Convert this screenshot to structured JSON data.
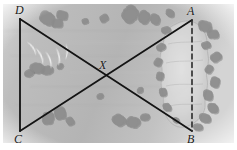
{
  "figure": {
    "name": "surveying-diagram-over-terrain-photo",
    "width": 237,
    "height": 150,
    "background_color": "#b6b6b6",
    "border_color": "#ffffff"
  },
  "labels": {
    "a": "A",
    "b": "B",
    "c": "C",
    "d": "D",
    "x": "X"
  },
  "points": {
    "A": {
      "x": 192,
      "y": 20,
      "label": "A",
      "label_x": 188,
      "label_y": 7
    },
    "B": {
      "x": 192,
      "y": 131,
      "label": "B",
      "label_x": 188,
      "label_y": 133
    },
    "C": {
      "x": 20,
      "y": 131,
      "label": "C",
      "label_x": 14,
      "label_y": 133
    },
    "D": {
      "x": 20,
      "y": 19,
      "label": "D",
      "label_x": 15,
      "label_y": 6
    },
    "X": {
      "x": 105,
      "y": 78,
      "label": "X",
      "label_x": 99,
      "label_y": 60
    }
  },
  "segments": [
    {
      "name": "segment-DC",
      "from": "D",
      "to": "C",
      "style": "solid",
      "color": "#141414",
      "width": 1.8
    },
    {
      "name": "segment-DB",
      "from": "D",
      "to": "B",
      "style": "solid",
      "color": "#141414",
      "width": 1.8
    },
    {
      "name": "segment-CA",
      "from": "C",
      "to": "A",
      "style": "solid",
      "color": "#141414",
      "width": 1.8
    },
    {
      "name": "segment-AB",
      "from": "A",
      "to": "B",
      "style": "dashed",
      "color": "#2a2a2a",
      "width": 1.6
    }
  ],
  "terrain": {
    "clearing_color": "#d8d8d8",
    "shrub_color": "#8e8e8e",
    "water_mark_color": "#f2f2f2",
    "shrubs": [
      {
        "cx": 47,
        "cy": 18,
        "r": 7
      },
      {
        "cx": 62,
        "cy": 15,
        "r": 5
      },
      {
        "cx": 57,
        "cy": 23,
        "r": 5
      },
      {
        "cx": 85,
        "cy": 21,
        "r": 3
      },
      {
        "cx": 104,
        "cy": 18,
        "r": 4
      },
      {
        "cx": 130,
        "cy": 14,
        "r": 8
      },
      {
        "cx": 144,
        "cy": 17,
        "r": 6
      },
      {
        "cx": 155,
        "cy": 19,
        "r": 5
      },
      {
        "cx": 170,
        "cy": 13,
        "r": 4
      },
      {
        "cx": 205,
        "cy": 26,
        "r": 6
      },
      {
        "cx": 213,
        "cy": 34,
        "r": 5
      },
      {
        "cx": 206,
        "cy": 45,
        "r": 4
      },
      {
        "cx": 216,
        "cy": 57,
        "r": 5
      },
      {
        "cx": 209,
        "cy": 69,
        "r": 4
      },
      {
        "cx": 215,
        "cy": 82,
        "r": 5
      },
      {
        "cx": 208,
        "cy": 95,
        "r": 5
      },
      {
        "cx": 213,
        "cy": 108,
        "r": 5
      },
      {
        "cx": 205,
        "cy": 118,
        "r": 5
      },
      {
        "cx": 198,
        "cy": 127,
        "r": 4
      },
      {
        "cx": 166,
        "cy": 30,
        "r": 4
      },
      {
        "cx": 161,
        "cy": 47,
        "r": 4
      },
      {
        "cx": 158,
        "cy": 62,
        "r": 4
      },
      {
        "cx": 160,
        "cy": 76,
        "r": 4
      },
      {
        "cx": 163,
        "cy": 92,
        "r": 4
      },
      {
        "cx": 167,
        "cy": 107,
        "r": 4
      },
      {
        "cx": 176,
        "cy": 120,
        "r": 3
      },
      {
        "cx": 37,
        "cy": 68,
        "r": 6
      },
      {
        "cx": 47,
        "cy": 70,
        "r": 5
      },
      {
        "cx": 29,
        "cy": 73,
        "r": 4
      },
      {
        "cx": 60,
        "cy": 66,
        "r": 3
      },
      {
        "cx": 48,
        "cy": 118,
        "r": 6
      },
      {
        "cx": 60,
        "cy": 113,
        "r": 6
      },
      {
        "cx": 70,
        "cy": 121,
        "r": 4
      },
      {
        "cx": 119,
        "cy": 120,
        "r": 6
      },
      {
        "cx": 133,
        "cy": 122,
        "r": 6
      },
      {
        "cx": 145,
        "cy": 117,
        "r": 4
      },
      {
        "cx": 100,
        "cy": 96,
        "r": 3
      },
      {
        "cx": 140,
        "cy": 90,
        "r": 3
      }
    ],
    "water_marks": [
      {
        "cx": 33,
        "cy": 48,
        "rx": 4,
        "ry": 8,
        "rot": -18
      },
      {
        "cx": 41,
        "cy": 56,
        "rx": 4,
        "ry": 9,
        "rot": -10
      },
      {
        "cx": 50,
        "cy": 60,
        "rx": 4,
        "ry": 9,
        "rot": -4
      },
      {
        "cx": 59,
        "cy": 57,
        "rx": 4,
        "ry": 9,
        "rot": 6
      },
      {
        "cx": 67,
        "cy": 52,
        "rx": 3,
        "ry": 8,
        "rot": 14
      }
    ]
  }
}
